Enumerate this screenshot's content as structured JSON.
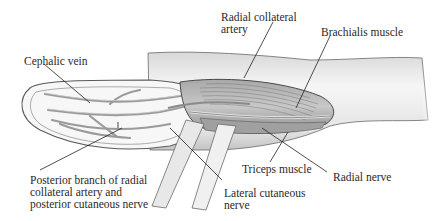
{
  "figure": {
    "colors": {
      "skin_fill": "#f3f3f3",
      "skin_shade": "#cfcfcf",
      "outline": "#5a5a5a",
      "muscle": "#b8b8b8",
      "muscle_dark": "#8a8a8a",
      "vessel": "#9a9a9a",
      "leader": "#222222",
      "text": "#2a2a2a"
    }
  },
  "labels": {
    "cephalic_vein": "Cephalic vein",
    "radial_collateral_artery_l1": "Radial collateral",
    "radial_collateral_artery_l2": "artery",
    "brachialis_muscle": "Brachialis muscle",
    "posterior_branch_l1": "Posterior branch of radial",
    "posterior_branch_l2": "collateral artery and",
    "posterior_branch_l3": "posterior cutaneous nerve",
    "triceps_muscle": "Triceps muscle",
    "radial_nerve": "Radial nerve",
    "lateral_cutaneous_l1": "Lateral cutaneous",
    "lateral_cutaneous_l2": "nerve"
  }
}
